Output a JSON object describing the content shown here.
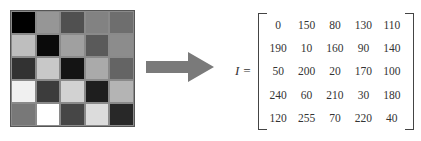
{
  "image_grid": {
    "rows": 5,
    "cols": 5
  },
  "equation": {
    "label": "I ="
  },
  "matrix": {
    "values": [
      [
        0,
        150,
        80,
        130,
        110
      ],
      [
        190,
        10,
        160,
        90,
        140
      ],
      [
        50,
        200,
        20,
        170,
        100
      ],
      [
        240,
        60,
        210,
        30,
        180
      ],
      [
        120,
        255,
        70,
        220,
        40
      ]
    ]
  },
  "arrow": {
    "icon": "right-arrow-icon",
    "color": "#7a7a7a"
  }
}
